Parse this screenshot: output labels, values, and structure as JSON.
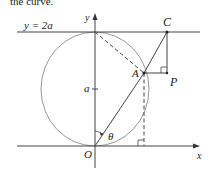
{
  "header_fragment": "the curve.",
  "labels": {
    "line_top": "y = 2a",
    "y_axis": "y",
    "x_axis": "x",
    "origin": "O",
    "point_A": "A",
    "point_C": "C",
    "point_P": "P",
    "radius_mark": "a",
    "angle": "θ"
  },
  "colors": {
    "stroke": "#333333",
    "circle": "#8a8a8a",
    "text": "#222222"
  }
}
